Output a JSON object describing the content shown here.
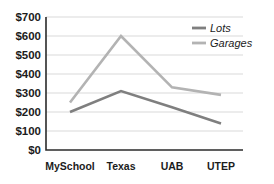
{
  "chart_data": {
    "type": "line",
    "title": "",
    "subtitle": "",
    "xlabel": "",
    "ylabel": "",
    "categories": [
      "MySchool",
      "Texas",
      "UAB",
      "UTEP"
    ],
    "series": [
      {
        "name": "Lots",
        "values": [
          200,
          310,
          225,
          140
        ],
        "color": "#7f7f7f"
      },
      {
        "name": "Garages",
        "values": [
          250,
          600,
          330,
          290
        ],
        "color": "#b3b3b3"
      }
    ],
    "ylim": [
      0,
      700
    ],
    "yticks": [
      0,
      100,
      200,
      300,
      400,
      500,
      600,
      700
    ],
    "ytick_labels": [
      "$0",
      "$100",
      "$200",
      "$300",
      "$400",
      "$500",
      "$600",
      "$700"
    ],
    "grid": true,
    "grid_axis": "y",
    "legend_position": "top-right",
    "legend_entries": [
      "Lots",
      "Garages"
    ],
    "annotations": []
  },
  "axes": {
    "y_axis_label_0": "$0",
    "y_axis_label_1": "$100",
    "y_axis_label_2": "$200",
    "y_axis_label_3": "$300",
    "y_axis_label_4": "$400",
    "y_axis_label_5": "$500",
    "y_axis_label_6": "$600",
    "y_axis_label_7": "$700",
    "x_axis_label_0": "MySchool",
    "x_axis_label_1": "Texas",
    "x_axis_label_2": "UAB",
    "x_axis_label_3": "UTEP"
  },
  "legend": {
    "item_0": "Lots",
    "item_1": "Garages"
  },
  "colors": {
    "lots": "#7f7f7f",
    "garages": "#b3b3b3",
    "grid": "#d9d9d9",
    "axis": "#2b2b2b",
    "text": "#1c1c1c",
    "background": "#ffffff"
  }
}
